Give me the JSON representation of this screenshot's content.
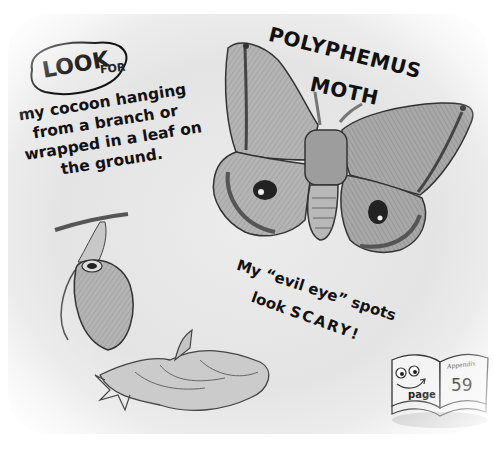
{
  "title": {
    "line1": "POLYPHEMUS",
    "line2": "MOTH"
  },
  "look_for": {
    "look": "LOOK",
    "for": "FOR",
    "instruction_lines": [
      "my cocoon hanging",
      "from a branch or",
      "wrapped in a leaf on",
      "the ground."
    ]
  },
  "caption": {
    "line1_a": "My",
    "line1_b": "“evil eye”",
    "line1_c": "spots",
    "line2_a": "look",
    "line2_b": "SCARY!"
  },
  "page_ref": {
    "appendix_label": "Appendix",
    "page_word": "page",
    "page_number": "59"
  },
  "illustrations": {
    "moth": "polyphemus-moth-drawing",
    "cocoon_branch": "cocoon-hanging-from-branch",
    "cocoon_leaves": "cocoon-wrapped-in-leaves"
  },
  "colors": {
    "paper": "#e6e6e6",
    "ink": "#111111",
    "wing_fill": "#a9a9a9",
    "wing_band": "#555555"
  }
}
